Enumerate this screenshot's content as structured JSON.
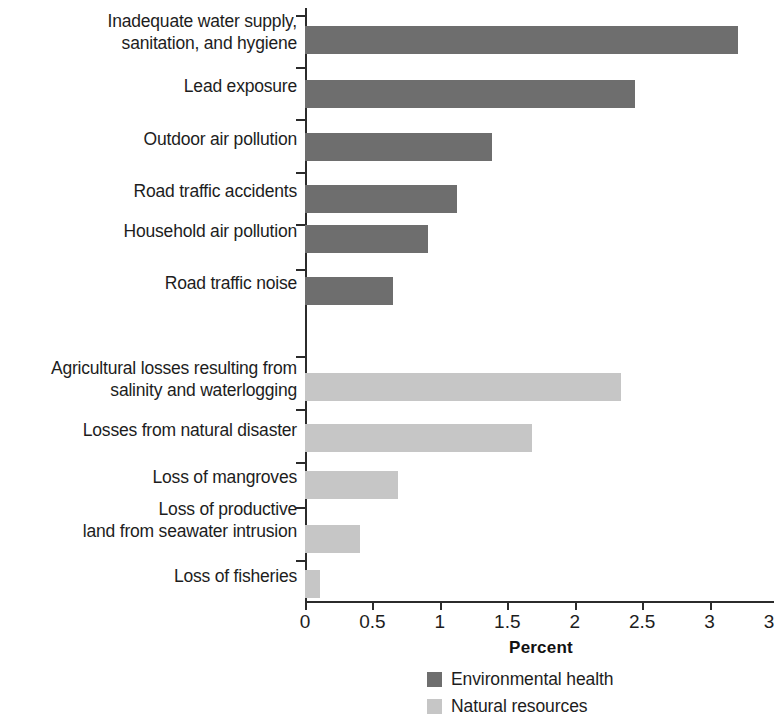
{
  "chart_data": {
    "type": "bar",
    "orientation": "horizontal",
    "title": "",
    "xlabel": "Percent",
    "ylabel": "",
    "xlim": [
      0,
      3.5
    ],
    "xticks": [
      "0",
      "0.5",
      "1",
      "1.5",
      "2",
      "2.5",
      "3",
      "3.5"
    ],
    "xtick_values": [
      0,
      0.5,
      1,
      1.5,
      2,
      2.5,
      3,
      3.5
    ],
    "grid": false,
    "legend_position": "bottom",
    "categories": [
      "Inadequate water supply,\nsanitation, and hygiene",
      "Lead exposure",
      "Outdoor air pollution",
      "Road traffic accidents",
      "Household air pollution",
      "Road traffic noise",
      "Agricultural losses resulting from\nsalinity and waterlogging",
      "Losses from natural disaster",
      "Loss of mangroves",
      "Loss of productive\nland from seawater intrusion",
      "Loss of fisheries"
    ],
    "values": [
      3.21,
      2.45,
      1.39,
      1.13,
      0.91,
      0.65,
      2.34,
      1.68,
      0.69,
      0.41,
      0.11
    ],
    "groups": [
      "Environmental health",
      "Environmental health",
      "Environmental health",
      "Environmental health",
      "Environmental health",
      "Environmental health",
      "Natural resources",
      "Natural resources",
      "Natural resources",
      "Natural resources",
      "Natural resources"
    ],
    "series": [
      {
        "name": "Environmental health",
        "color": "#6e6e6e",
        "points": [
          {
            "category": "Inadequate water supply,\nsanitation, and hygiene",
            "value": 3.21
          },
          {
            "category": "Lead exposure",
            "value": 2.45
          },
          {
            "category": "Outdoor air pollution",
            "value": 1.39
          },
          {
            "category": "Road traffic accidents",
            "value": 1.13
          },
          {
            "category": "Household air pollution",
            "value": 0.91
          },
          {
            "category": "Road traffic noise",
            "value": 0.65
          }
        ]
      },
      {
        "name": "Natural resources",
        "color": "#c6c6c6",
        "points": [
          {
            "category": "Agricultural losses resulting from\nsalinity and waterlogging",
            "value": 2.34
          },
          {
            "category": "Losses from natural disaster",
            "value": 1.68
          },
          {
            "category": "Loss of mangroves",
            "value": 0.69
          },
          {
            "category": "Loss of productive\nland from seawater intrusion",
            "value": 0.41
          },
          {
            "category": "Loss of fisheries",
            "value": 0.11
          }
        ]
      }
    ]
  },
  "axis": {
    "x_title": "Percent",
    "ticks": [
      {
        "label": "0",
        "value": 0
      },
      {
        "label": "0.5",
        "value": 0.5
      },
      {
        "label": "1",
        "value": 1
      },
      {
        "label": "1.5",
        "value": 1.5
      },
      {
        "label": "2",
        "value": 2
      },
      {
        "label": "2.5",
        "value": 2.5
      },
      {
        "label": "3",
        "value": 3
      },
      {
        "label": "3.5",
        "value": 3.5
      }
    ]
  },
  "legend": {
    "items": [
      {
        "label": "Environmental health",
        "color": "#6e6e6e",
        "swatch": "legend-swatch-dark"
      },
      {
        "label": "Natural resources",
        "color": "#c6c6c6",
        "swatch": "legend-swatch-light"
      }
    ]
  },
  "rows": [
    {
      "label": "Inadequate water supply,\nsanitation, and hygiene",
      "value": 3.21,
      "group": "health",
      "center": 32,
      "label_top": 10,
      "tick_top": 8
    },
    {
      "label": "Lead exposure",
      "value": 2.45,
      "group": "health",
      "center": 86,
      "label_top": 75,
      "tick_top": 60
    },
    {
      "label": "Outdoor air pollution",
      "value": 1.39,
      "group": "health",
      "center": 139,
      "label_top": 128,
      "tick_top": 112
    },
    {
      "label": "Road traffic accidents",
      "value": 1.13,
      "group": "health",
      "center": 191,
      "label_top": 180,
      "tick_top": 165
    },
    {
      "label": "Household air pollution",
      "value": 0.91,
      "group": "health",
      "center": 231,
      "label_top": 220,
      "tick_top": 217
    },
    {
      "label": "Road traffic noise",
      "value": 0.65,
      "group": "health",
      "center": 283,
      "label_top": 272,
      "tick_top": 262
    },
    {
      "label": "Agricultural losses resulting from\nsalinity and waterlogging",
      "value": 2.34,
      "group": "natural",
      "center": 379,
      "label_top": 357,
      "tick_top": 349
    },
    {
      "label": "Losses from natural disaster",
      "value": 1.68,
      "group": "natural",
      "center": 430,
      "label_top": 419,
      "tick_top": 402
    },
    {
      "label": "Loss of mangroves",
      "value": 0.69,
      "group": "natural",
      "center": 477,
      "label_top": 466,
      "tick_top": 455
    },
    {
      "label": "Loss of productive\nland from seawater intrusion",
      "value": 0.41,
      "group": "natural",
      "center": 531,
      "label_top": 498,
      "tick_top": 500
    },
    {
      "label": "Loss of fisheries",
      "value": 0.11,
      "group": "natural",
      "center": 576,
      "label_top": 565,
      "tick_top": 553
    }
  ]
}
